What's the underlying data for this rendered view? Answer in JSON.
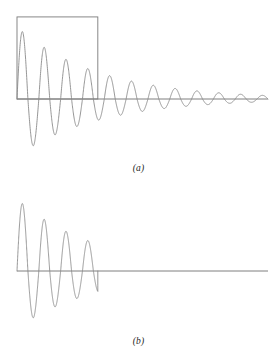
{
  "figure": {
    "panels": [
      {
        "id": "a",
        "label": "(a)",
        "description": "damped-oscillation-with-truncation-window"
      },
      {
        "id": "b",
        "label": "(b)",
        "description": "truncated-damped-oscillation"
      }
    ],
    "caption_fragment": ""
  },
  "colors": {
    "curve": "#8a8a8a",
    "axis": "#6f6f6f",
    "window": "#7a7a7a",
    "background": "#ffffff",
    "label": "#262626"
  },
  "chart_data": [
    {
      "type": "line",
      "title": "",
      "subtitle": "",
      "xlabel": "",
      "ylabel": "",
      "grid": false,
      "legend": null,
      "annotations": [
        {
          "kind": "rectangle-window",
          "label": "truncation window",
          "x0": 0.0,
          "x1": 0.322,
          "y0": 0.0,
          "y1": 1.14
        }
      ],
      "xlim": [
        0,
        1
      ],
      "ylim": [
        -1.12,
        1.2
      ],
      "axis_y": 0,
      "series": [
        {
          "name": "damped sinusoid",
          "damping": 3.05,
          "cycles": 11.5,
          "amplitude": 1.0,
          "x": [
            0.0,
            0.01,
            0.02,
            0.03,
            0.04,
            0.05,
            0.06,
            0.07,
            0.08,
            0.09,
            0.1,
            0.11,
            0.12,
            0.13,
            0.14,
            0.15,
            0.16,
            0.17,
            0.18,
            0.19,
            0.2,
            0.21,
            0.22,
            0.23,
            0.24,
            0.25,
            0.26,
            0.27,
            0.28,
            0.29,
            0.3,
            0.31,
            0.322,
            0.34,
            0.36,
            0.38,
            0.4,
            0.42,
            0.44,
            0.46,
            0.48,
            0.5,
            0.52,
            0.54,
            0.56,
            0.58,
            0.6,
            0.62,
            0.64,
            0.66,
            0.68,
            0.7,
            0.72,
            0.74,
            0.76,
            0.78,
            0.8,
            0.82,
            0.84,
            0.86,
            0.88,
            0.9,
            0.92,
            0.94,
            0.96,
            0.98,
            1.0
          ],
          "y": [
            0.0,
            0.65,
            0.985,
            0.88,
            0.395,
            -0.215,
            -0.7,
            -0.905,
            -0.77,
            -0.33,
            0.195,
            0.6,
            0.76,
            0.615,
            0.235,
            -0.2,
            -0.52,
            -0.625,
            -0.48,
            -0.155,
            0.195,
            0.44,
            0.51,
            0.385,
            0.115,
            -0.175,
            -0.37,
            -0.415,
            -0.3,
            -0.08,
            0.145,
            0.3,
            0.345,
            0.215,
            -0.03,
            -0.23,
            -0.28,
            -0.175,
            0.02,
            0.185,
            0.222,
            0.135,
            -0.02,
            -0.15,
            -0.175,
            -0.1,
            0.02,
            0.118,
            0.138,
            0.078,
            -0.012,
            -0.09,
            -0.108,
            -0.06,
            0.008,
            0.07,
            0.083,
            0.046,
            -0.006,
            -0.053,
            -0.062,
            -0.034,
            0.004,
            0.038,
            0.045,
            0.024,
            0.0
          ]
        }
      ]
    },
    {
      "type": "line",
      "title": "",
      "subtitle": "",
      "xlabel": "",
      "ylabel": "",
      "grid": false,
      "legend": null,
      "annotations": [
        {
          "kind": "truncation-point",
          "label": "abrupt cutoff",
          "x": 0.322
        }
      ],
      "xlim": [
        0,
        1
      ],
      "ylim": [
        -1.12,
        1.2
      ],
      "axis_y": 0,
      "series": [
        {
          "name": "truncated damped sinusoid",
          "damping": 3.05,
          "cycles": 11.5,
          "amplitude": 1.0,
          "truncated_at": 0.322,
          "x": [
            0.0,
            0.01,
            0.02,
            0.03,
            0.04,
            0.05,
            0.06,
            0.07,
            0.08,
            0.09,
            0.1,
            0.11,
            0.12,
            0.13,
            0.14,
            0.15,
            0.16,
            0.17,
            0.18,
            0.19,
            0.2,
            0.21,
            0.22,
            0.23,
            0.24,
            0.25,
            0.26,
            0.27,
            0.28,
            0.29,
            0.3,
            0.31,
            0.322
          ],
          "y": [
            0.0,
            0.65,
            0.985,
            0.88,
            0.395,
            -0.215,
            -0.7,
            -0.905,
            -0.77,
            -0.33,
            0.195,
            0.6,
            0.76,
            0.615,
            0.235,
            -0.2,
            -0.52,
            -0.625,
            -0.48,
            -0.155,
            0.195,
            0.44,
            0.51,
            0.385,
            0.115,
            -0.175,
            -0.37,
            -0.415,
            -0.3,
            -0.08,
            0.145,
            0.3,
            -0.25
          ]
        }
      ]
    }
  ]
}
